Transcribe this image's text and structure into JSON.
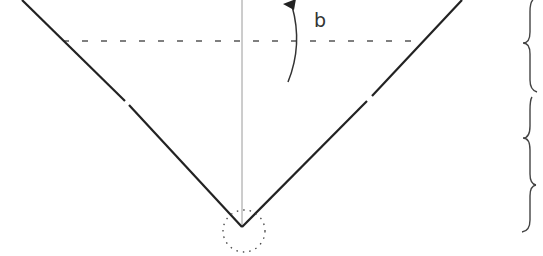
{
  "diagram": {
    "type": "technical-line-diagram",
    "labels": {
      "rotation_label": "b"
    },
    "colors": {
      "main_line": "#222222",
      "axis_line": "#999999",
      "dashed_line": "#555555",
      "brace": "#444444",
      "background": "#ffffff"
    },
    "geometry": {
      "apex": [
        242,
        227
      ],
      "left_top": [
        22,
        0
      ],
      "right_top": [
        462,
        0
      ],
      "dashed_y": 41,
      "dashed_x_range": [
        63,
        418
      ],
      "circle_center": [
        244,
        231
      ],
      "circle_radius": 21
    },
    "braces": [
      {
        "name": "upper",
        "y_range": [
          0,
          92
        ]
      },
      {
        "name": "middle",
        "y_range": [
          97,
          185
        ]
      },
      {
        "name": "lower",
        "y_range": [
          185,
          232
        ]
      }
    ]
  }
}
